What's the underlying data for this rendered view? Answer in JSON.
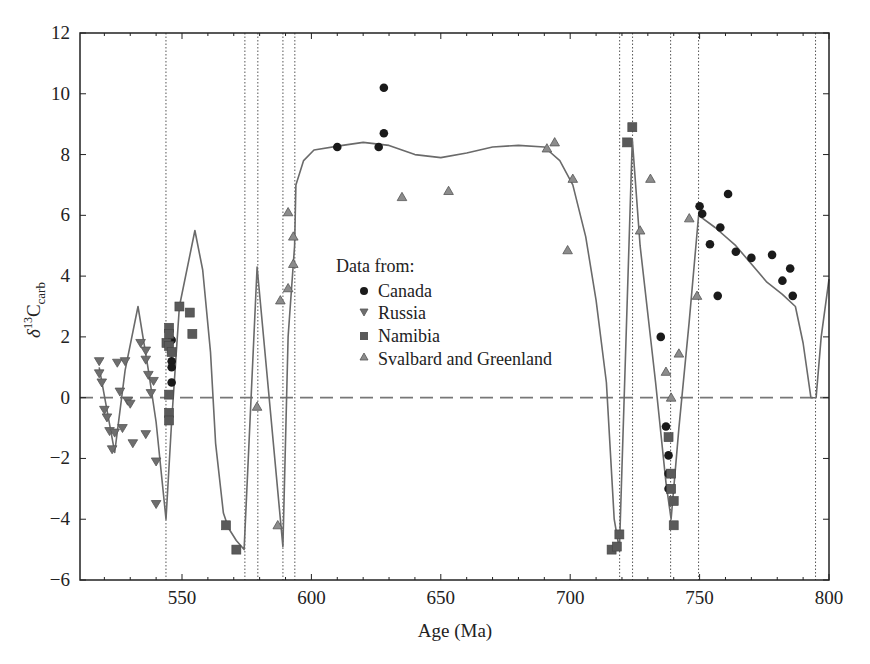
{
  "chart_data": {
    "type": "scatter",
    "title": "",
    "xlabel": "Age (Ma)",
    "ylabel": "δ13Ccarb",
    "ylabel_parts": {
      "delta": "δ",
      "sup": "13",
      "main": "C",
      "sub": "carb"
    },
    "xlim": [
      510.6,
      800
    ],
    "ylim": [
      -6,
      12
    ],
    "x_ticks": [
      550,
      600,
      650,
      700,
      750,
      800
    ],
    "y_ticks": [
      -6,
      -4,
      -2,
      0,
      2,
      4,
      6,
      8,
      10,
      12
    ],
    "x_minor_step": 10,
    "grid": false,
    "zero_line": {
      "y": 0,
      "style": "dashed"
    },
    "vertical_dotted_lines": [
      543.8,
      574.3,
      579.3,
      589.0,
      593.6,
      719.1,
      724.1,
      738.8,
      749.6,
      794.8
    ],
    "legend": {
      "title": "Data from:",
      "position": "inside-center",
      "entries": [
        {
          "label": "Canada",
          "marker": "circle"
        },
        {
          "label": "Russia",
          "marker": "triangle-down"
        },
        {
          "label": "Namibia",
          "marker": "square"
        },
        {
          "label": "Svalbard and Greenland",
          "marker": "triangle-up"
        }
      ]
    },
    "colors": {
      "canada": "#1a1a1a",
      "russia": "#6e6e6e",
      "namibia": "#5a5a5a",
      "svalbard": "#8c8c8c",
      "curve": "#6a6a6a",
      "axis": "#222222"
    },
    "series": [
      {
        "name": "Canada",
        "marker": "circle",
        "points": [
          [
            546,
            1.9
          ],
          [
            546,
            1.5
          ],
          [
            546,
            1.2
          ],
          [
            546,
            1.0
          ],
          [
            546,
            0.5
          ],
          [
            610,
            8.25
          ],
          [
            626,
            8.25
          ],
          [
            628,
            8.7
          ],
          [
            628,
            10.2
          ],
          [
            735,
            2.0
          ],
          [
            737,
            -0.95
          ],
          [
            738,
            -1.9
          ],
          [
            738,
            -2.5
          ],
          [
            738,
            -3.0
          ],
          [
            750,
            6.3
          ],
          [
            751,
            6.05
          ],
          [
            754,
            5.05
          ],
          [
            757,
            3.35
          ],
          [
            758,
            5.6
          ],
          [
            761,
            6.7
          ],
          [
            764,
            4.8
          ],
          [
            770,
            4.6
          ],
          [
            778,
            4.7
          ],
          [
            782,
            3.85
          ],
          [
            785,
            4.25
          ],
          [
            786,
            3.35
          ]
        ]
      },
      {
        "name": "Russia",
        "marker": "triangle-down",
        "points": [
          [
            518,
            1.2
          ],
          [
            518,
            0.8
          ],
          [
            519,
            0.5
          ],
          [
            520,
            -0.4
          ],
          [
            521,
            -0.65
          ],
          [
            522,
            -1.1
          ],
          [
            523,
            -1.7
          ],
          [
            524,
            -1.15
          ],
          [
            525,
            1.15
          ],
          [
            526,
            0.2
          ],
          [
            527,
            -1.0
          ],
          [
            528,
            1.2
          ],
          [
            529,
            -0.1
          ],
          [
            530,
            -0.2
          ],
          [
            531,
            -1.5
          ],
          [
            534,
            1.8
          ],
          [
            536,
            1.55
          ],
          [
            536,
            1.25
          ],
          [
            537,
            0.75
          ],
          [
            538,
            0.15
          ],
          [
            539,
            0.55
          ],
          [
            540,
            -2.1
          ],
          [
            540,
            -3.5
          ],
          [
            536,
            -1.2
          ]
        ]
      },
      {
        "name": "Namibia",
        "marker": "square",
        "points": [
          [
            544,
            1.8
          ],
          [
            545,
            2.3
          ],
          [
            545,
            2.1
          ],
          [
            545,
            1.7
          ],
          [
            546,
            1.5
          ],
          [
            545,
            0.1
          ],
          [
            545,
            -0.5
          ],
          [
            545,
            -0.75
          ],
          [
            549,
            3.0
          ],
          [
            553,
            2.8
          ],
          [
            554,
            2.1
          ],
          [
            567,
            -4.2
          ],
          [
            571,
            -5.0
          ],
          [
            716,
            -5.0
          ],
          [
            718,
            -4.9
          ],
          [
            719,
            -4.5
          ],
          [
            722,
            8.4
          ],
          [
            724,
            8.9
          ],
          [
            738,
            -1.3
          ],
          [
            739,
            -2.5
          ],
          [
            739,
            -3.0
          ],
          [
            740,
            -3.4
          ],
          [
            740,
            -4.2
          ]
        ]
      },
      {
        "name": "Svalbard and Greenland",
        "marker": "triangle-up",
        "points": [
          [
            579,
            -0.3
          ],
          [
            587,
            -4.2
          ],
          [
            588,
            3.2
          ],
          [
            591,
            6.1
          ],
          [
            591,
            3.6
          ],
          [
            593,
            5.3
          ],
          [
            593,
            4.4
          ],
          [
            635,
            6.6
          ],
          [
            653,
            6.8
          ],
          [
            691,
            8.2
          ],
          [
            694,
            8.4
          ],
          [
            699,
            4.85
          ],
          [
            701,
            7.2
          ],
          [
            727,
            5.5
          ],
          [
            731,
            7.2
          ],
          [
            737,
            0.85
          ],
          [
            739,
            0.0
          ],
          [
            742,
            1.45
          ],
          [
            746,
            5.9
          ],
          [
            749,
            3.35
          ]
        ]
      },
      {
        "name": "Model curve",
        "marker": "line",
        "points": [
          [
            518,
            1.0
          ],
          [
            524,
            -1.8
          ],
          [
            528,
            0.9
          ],
          [
            533,
            3.0
          ],
          [
            537,
            0.9
          ],
          [
            540,
            -0.8
          ],
          [
            543.8,
            -4.0
          ],
          [
            546,
            -0.8
          ],
          [
            549,
            3.0
          ],
          [
            555,
            5.5
          ],
          [
            558,
            4.2
          ],
          [
            561,
            1.5
          ],
          [
            563,
            -1.5
          ],
          [
            566,
            -3.8
          ],
          [
            568,
            -4.3
          ],
          [
            571,
            -4.7
          ],
          [
            574,
            -5.0
          ],
          [
            579,
            4.3
          ],
          [
            589,
            -4.9
          ],
          [
            591,
            2.0
          ],
          [
            593.5,
            5.0
          ],
          [
            594,
            7.0
          ],
          [
            597,
            7.8
          ],
          [
            601,
            8.15
          ],
          [
            612,
            8.3
          ],
          [
            620,
            8.4
          ],
          [
            630,
            8.3
          ],
          [
            640,
            8.0
          ],
          [
            650,
            7.9
          ],
          [
            660,
            8.05
          ],
          [
            670,
            8.25
          ],
          [
            680,
            8.3
          ],
          [
            690,
            8.25
          ],
          [
            696,
            7.8
          ],
          [
            701,
            7.0
          ],
          [
            706,
            5.3
          ],
          [
            710,
            3.2
          ],
          [
            714,
            0.5
          ],
          [
            716,
            -2.5
          ],
          [
            717,
            -4.0
          ],
          [
            719,
            -5.0
          ],
          [
            724,
            8.5
          ],
          [
            727,
            5.0
          ],
          [
            733,
            0.5
          ],
          [
            737,
            -2.8
          ],
          [
            739,
            -4.0
          ],
          [
            742,
            -1.0
          ],
          [
            746,
            2.5
          ],
          [
            749.6,
            6.0
          ],
          [
            756,
            5.6
          ],
          [
            764,
            5.0
          ],
          [
            770,
            4.4
          ],
          [
            776,
            3.8
          ],
          [
            782,
            3.4
          ],
          [
            787,
            3.0
          ],
          [
            790,
            1.8
          ],
          [
            793,
            0.0
          ],
          [
            795,
            0.0
          ],
          [
            797,
            2.0
          ],
          [
            800,
            3.9
          ]
        ]
      }
    ]
  }
}
